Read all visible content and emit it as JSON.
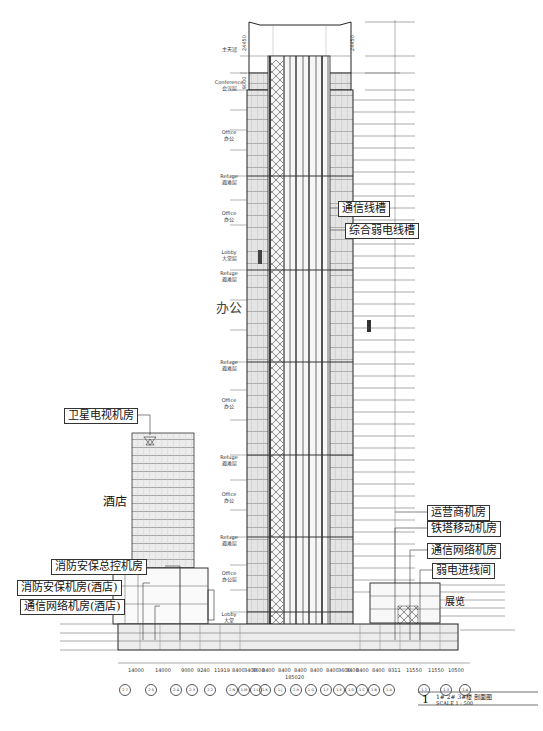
{
  "drawing": {
    "title": "1# 2# 3#楼 剖面图",
    "scale": "SCALE 1 : 500",
    "sheet_number": "1"
  },
  "tower_zones": [
    {
      "en": "",
      "cn": "主天冠",
      "y": 48
    },
    {
      "en": "Conference",
      "cn": "会议层",
      "y": 82
    },
    {
      "en": "Office",
      "cn": "办公",
      "y": 132
    },
    {
      "en": "Refuge",
      "cn": "避难层",
      "y": 176
    },
    {
      "en": "Office",
      "cn": "办公",
      "y": 213
    },
    {
      "en": "Lobby",
      "cn": "大堂层",
      "y": 252
    },
    {
      "en": "Refuge",
      "cn": "避难层",
      "y": 273
    },
    {
      "en": "Refuge",
      "cn": "避难层",
      "y": 362
    },
    {
      "en": "Office",
      "cn": "办公",
      "y": 400
    },
    {
      "en": "Refuge",
      "cn": "避难层",
      "y": 457
    },
    {
      "en": "Office",
      "cn": "办公",
      "y": 494
    },
    {
      "en": "Refuge",
      "cn": "避难层",
      "y": 537
    },
    {
      "en": "Office",
      "cn": "办公层",
      "y": 573
    },
    {
      "en": "Lobby",
      "cn": "大堂",
      "y": 614
    }
  ],
  "large_labels": {
    "office_big": "办公",
    "hotel": "酒店",
    "podium": "展览",
    "culture_center": "文化中心"
  },
  "callouts": {
    "comm_trench": "通信线槽",
    "weak_current_trench": "综合弱电线槽",
    "satellite_tv_room": "卫星电视机房",
    "operator_room": "运营商机房",
    "tower_mobile_room": "铁塔移动机房",
    "comm_network_room": "通信网络机房",
    "weak_current_entry": "弱电进线间",
    "fire_security_control": "消防安保总控机房",
    "fire_security_hotel": "消防安保机房(酒店)",
    "comm_network_hotel": "通信网络机房(酒店)"
  },
  "dimensions": {
    "bays": [
      "14000",
      "14000",
      "9000",
      "9240",
      "11919",
      "8400",
      "3400",
      "3600",
      "8400",
      "8400",
      "8400",
      "8400",
      "8400",
      "3600",
      "3400",
      "8400",
      "8400",
      "9311",
      "11550",
      "11550",
      "10500"
    ],
    "total": "185020",
    "top_height": "24450",
    "crown_height": "24450",
    "conference_height": "9000"
  },
  "axes": [
    "2-7",
    "2-5",
    "2-4",
    "2-3",
    "2-2",
    "1-N",
    "1-M",
    "1-L",
    "1-K",
    "1-J",
    "1-H",
    "1-G",
    "1-F",
    "1-E",
    "1-D",
    "1-C",
    "1-B",
    "1-A",
    "1-2",
    "1-3",
    "1-4"
  ]
}
